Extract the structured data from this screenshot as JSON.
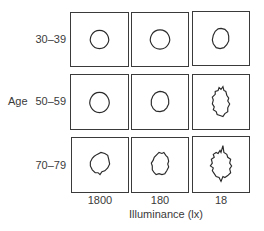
{
  "figure": {
    "row_axis_label": "Age",
    "rows": [
      {
        "label": "30–39"
      },
      {
        "label": "50–59"
      },
      {
        "label": "70–79"
      }
    ],
    "columns": [
      {
        "label": "1800"
      },
      {
        "label": "180"
      },
      {
        "label": "18"
      }
    ],
    "x_axis_title": "Illuminance (lx)",
    "cells": [
      [
        "smooth circle",
        "smooth circle",
        "slightly irregular circle"
      ],
      [
        "smooth circle",
        "slightly irregular circle",
        "highly irregular jagged shape"
      ],
      [
        "irregular shape",
        "irregular jagged shape",
        "highly irregular spiky shape"
      ]
    ],
    "colors": {
      "line": "#2a2a2a",
      "frame": "#3a3a3a",
      "background": "#ffffff"
    }
  }
}
